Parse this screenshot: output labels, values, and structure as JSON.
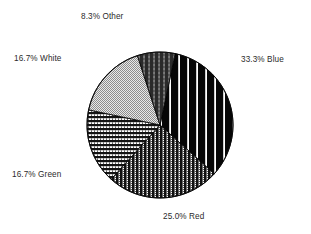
{
  "chart_data": {
    "type": "pie",
    "title": "",
    "subtitle": "",
    "xlabel": "",
    "ylabel": "",
    "legend_position": "none",
    "grid": false,
    "labels": [
      "Blue",
      "Red",
      "Green",
      "White",
      "Other"
    ],
    "values": [
      33.3,
      25.0,
      16.7,
      16.7,
      8.3
    ],
    "value_suffix": "%",
    "slices": [
      {
        "name": "Blue",
        "value": 33.3,
        "label": "33.3% Blue",
        "percent_text": "33.3%",
        "fill_pattern": "vertical-stripes-wide-black",
        "fill_color": "#0b0b0b",
        "start_angle_deg": 12,
        "sweep_deg": 120,
        "label_position": "right"
      },
      {
        "name": "Red",
        "value": 25.0,
        "label": "25.0% Red",
        "percent_text": "25.0%",
        "fill_pattern": "vertical-stripes-dense-dither",
        "fill_color": "#1d1d1d",
        "start_angle_deg": 132,
        "sweep_deg": 90,
        "label_position": "bottom"
      },
      {
        "name": "Green",
        "value": 16.7,
        "label": "16.7% Green",
        "percent_text": "16.7%",
        "fill_pattern": "horizontal-stripes-dither",
        "fill_color": "#222222",
        "start_angle_deg": 222,
        "sweep_deg": 60,
        "label_position": "left-lower"
      },
      {
        "name": "White",
        "value": 16.7,
        "label": "16.7% White",
        "percent_text": "16.7%",
        "fill_pattern": "checkerboard-dither-light",
        "fill_color": "#b4b4b4",
        "start_angle_deg": 282,
        "sweep_deg": 60,
        "label_position": "left-upper"
      },
      {
        "name": "Other",
        "value": 8.3,
        "label": "8.3% Other",
        "percent_text": "8.3%",
        "fill_pattern": "vertical-stripes-dark-gray",
        "fill_color": "#3a3a3a",
        "start_angle_deg": 342,
        "sweep_deg": 30,
        "label_position": "top"
      }
    ],
    "geometry": {
      "center_x": 160,
      "center_y": 125,
      "radius": 73
    },
    "colors": {
      "background": "#ffffff",
      "label_text": "#2b2b2b",
      "outline": "#000000"
    }
  }
}
